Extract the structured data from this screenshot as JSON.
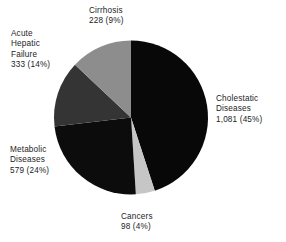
{
  "chart_data": {
    "type": "pie",
    "title": "",
    "subtitle": "",
    "xlabel": "",
    "ylabel": "",
    "legend_position": "none",
    "grid": false,
    "total": 2319,
    "value_format": "count (percent)",
    "start_angle_deg": 0,
    "direction": "clockwise",
    "categories": [
      "Cholestatic Diseases",
      "Cancers",
      "Metabolic Diseases",
      "Acute Hepatic Failure",
      "Cirrhosis"
    ],
    "values": [
      1081,
      98,
      579,
      333,
      228
    ],
    "percentages": [
      45,
      4,
      24,
      14,
      9
    ],
    "colors": [
      "#080808",
      "#c6c6c6",
      "#0c0c0c",
      "#343434",
      "#8d8d8d"
    ],
    "slices": [
      {
        "name": "Cholestatic Diseases",
        "value": 1081,
        "value_text": "1,081",
        "percent": 45,
        "percent_text": "(45%)",
        "color": "#080808",
        "start_deg": 0,
        "end_deg": 162
      },
      {
        "name": "Cancers",
        "value": 98,
        "value_text": "98",
        "percent": 4,
        "percent_text": "(4%)",
        "color": "#c6c6c6",
        "start_deg": 162,
        "end_deg": 176.4
      },
      {
        "name": "Metabolic Diseases",
        "value": 579,
        "value_text": "579",
        "percent": 24,
        "percent_text": "(24%)",
        "color": "#0c0c0c",
        "start_deg": 176.4,
        "end_deg": 263.3
      },
      {
        "name": "Acute Hepatic Failure",
        "value": 333,
        "value_text": "333",
        "percent": 14,
        "percent_text": "(14%)",
        "color": "#343434",
        "start_deg": 263.3,
        "end_deg": 313.3
      },
      {
        "name": "Cirrhosis",
        "value": 228,
        "value_text": "228",
        "percent": 9,
        "percent_text": "(9%)",
        "color": "#8d8d8d",
        "start_deg": 313.3,
        "end_deg": 360
      }
    ]
  },
  "labels": {
    "cirrhosis": {
      "line1": "Cirrhosis",
      "line2": "228 (9%)"
    },
    "cholestatic": {
      "line1": "Cholestatic",
      "line2": "Diseases",
      "line3": "1,081 (45%)"
    },
    "cancers": {
      "line1": "Cancers",
      "line2": "98 (4%)"
    },
    "metabolic": {
      "line1": "Metabolic",
      "line2": "Diseases",
      "line3": "579 (24%)"
    },
    "acute_hepatic_failure": {
      "line1": "Acute",
      "line2": "Hepatic",
      "line3": "Failure",
      "line4": "333 (14%)"
    }
  }
}
